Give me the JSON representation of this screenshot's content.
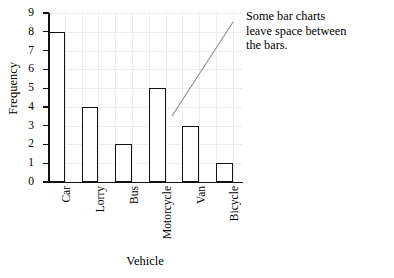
{
  "chart_data": {
    "type": "bar",
    "title": "",
    "subtitle": "",
    "categories": [
      "Car",
      "Lorry",
      "Bus",
      "Motorcycle",
      "Van",
      "Bicycle"
    ],
    "values": [
      8,
      4,
      2,
      5,
      3,
      1
    ],
    "xlabel": "Vehicle",
    "ylabel": "Frequency",
    "ylim": [
      0,
      9
    ],
    "ytick_labels": [
      "0",
      "1",
      "2",
      "3",
      "4",
      "5",
      "6",
      "7",
      "8",
      "9"
    ],
    "ytick_values": [
      0,
      1,
      2,
      3,
      4,
      5,
      6,
      7,
      8,
      9
    ],
    "grid": true,
    "grid_color": "#ededed",
    "legend": false,
    "legend_position": "none",
    "bar_color": "#ffffff",
    "bar_edge_color": "#111111",
    "axis_color": "#111111",
    "annotations": [
      {
        "text": "Some bar charts leave space between the bars.",
        "leader_line": true,
        "leader_color": "#8c8c8c"
      }
    ]
  },
  "annotation": {
    "line1": "Some bar charts",
    "line2": "leave space between",
    "line3": "the bars."
  }
}
